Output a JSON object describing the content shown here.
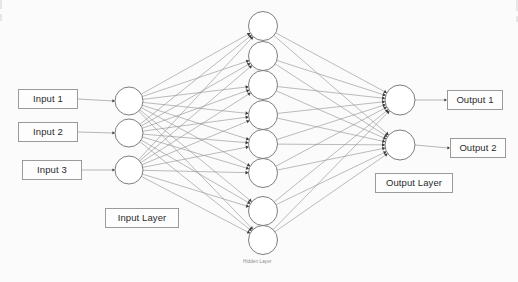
{
  "diagram": {
    "background_color": "#fbfbfb",
    "edge_color": "#8e8e8e",
    "node_stroke_color": "#6f6f6f",
    "node_fill_color": "#ffffff",
    "arrow_color": "#3a3a3a",
    "box_border_color": "#9b9b9b",
    "text_color": "#2b2b2b",
    "muted_text_color": "#8a8a8a"
  },
  "input_labels": [
    {
      "text": "Input 1",
      "x": 18,
      "y": 89,
      "w": 60,
      "h": 20
    },
    {
      "text": "Input 2",
      "x": 18,
      "y": 122,
      "w": 60,
      "h": 20
    },
    {
      "text": "Input 3",
      "x": 22,
      "y": 160,
      "w": 60,
      "h": 20
    }
  ],
  "output_labels": [
    {
      "text": "Output 1",
      "x": 447,
      "y": 90,
      "w": 56,
      "h": 20
    },
    {
      "text": "Output 2",
      "x": 450,
      "y": 138,
      "w": 56,
      "h": 20
    }
  ],
  "layer_labels": [
    {
      "text": "Input Layer",
      "kind": "box",
      "x": 105,
      "y": 208,
      "w": 74,
      "h": 20
    },
    {
      "text": "Output Layer",
      "kind": "box",
      "x": 375,
      "y": 173,
      "w": 78,
      "h": 20
    },
    {
      "text": "Hidden Layer",
      "kind": "plain",
      "x": 243,
      "y": 260,
      "w": 44,
      "h": 8
    }
  ],
  "layers": {
    "input": {
      "name": "Input Layer",
      "node_count": 3,
      "radius": 14,
      "cx": 129,
      "nodes": [
        {
          "id": "i1",
          "cy": 101
        },
        {
          "id": "i2",
          "cy": 133
        },
        {
          "id": "i3",
          "cy": 170
        }
      ]
    },
    "hidden": {
      "name": "Hidden Layer",
      "node_count": 8,
      "radius": 14.5,
      "cx": 263,
      "nodes": [
        {
          "id": "h1",
          "cy": 26
        },
        {
          "id": "h2",
          "cy": 56
        },
        {
          "id": "h3",
          "cy": 85
        },
        {
          "id": "h4",
          "cy": 115
        },
        {
          "id": "h5",
          "cy": 144
        },
        {
          "id": "h6",
          "cy": 173
        },
        {
          "id": "h7",
          "cy": 211
        },
        {
          "id": "h8",
          "cy": 240
        }
      ]
    },
    "output": {
      "name": "Output Layer",
      "node_count": 2,
      "radius": 15,
      "cx": 400,
      "nodes": [
        {
          "id": "o1",
          "cy": 100
        },
        {
          "id": "o2",
          "cy": 145
        }
      ]
    }
  },
  "connections": {
    "input_to_hidden": "fully-connected",
    "hidden_to_output": "fully-connected",
    "input_label_to_node": "one-to-one",
    "output_node_to_label": "one-to-one",
    "total_edges": 40
  },
  "edge_artifacts": [
    {
      "x": 0,
      "y": 0,
      "w": 2,
      "h": 9
    },
    {
      "x": 0,
      "y": 14,
      "w": 2,
      "h": 7
    },
    {
      "x": 516,
      "y": 0,
      "w": 2,
      "h": 11
    },
    {
      "x": 516,
      "y": 16,
      "w": 2,
      "h": 6
    }
  ]
}
